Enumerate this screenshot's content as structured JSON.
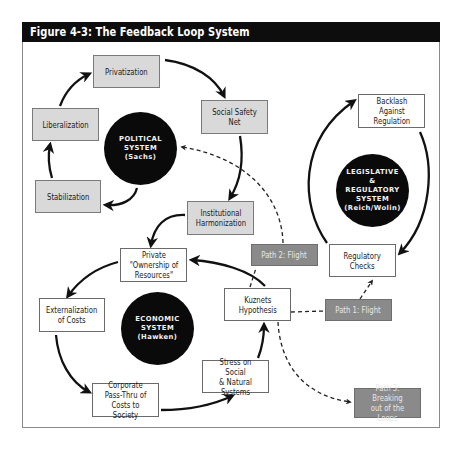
{
  "figure": {
    "title": "Figure 4-3: The Feedback Loop System"
  },
  "systems": {
    "political": {
      "label": "POLITICAL\nSYSTEM\n(Sachs)"
    },
    "legislative": {
      "label": "LEGISLATIVE\n&\nREGULATORY\nSYSTEM\n(Reich/Wolin)"
    },
    "economic": {
      "label": "ECONOMIC\nSYSTEM\n(Hawken)"
    }
  },
  "political_loop": {
    "privatization": "Privatization",
    "social_safety_net": "Social Safety\nNet",
    "institutional_harmonization": "Institutional\nHarmonization",
    "stabilization": "Stabilization",
    "liberalization": "Liberalization"
  },
  "legislative_loop": {
    "backlash": "Backlash\nAgainst\nRegulation",
    "regulatory_checks": "Regulatory\nChecks"
  },
  "economic_loop": {
    "private_ownership": "Private\n\"Ownership of\nResources\"",
    "externalization": "Externalization\nof Costs",
    "corporate_pass_thru": "Corporate\nPass-Thru of\nCosts to Society",
    "stress": "Stress on Social\n& Natural\nSystems",
    "kuznets": "Kuznets\nHypothesis"
  },
  "paths": {
    "path1": "Path 1: Flight",
    "path2": "Path 2: Flight",
    "path3": "Path 3: Breaking\nout of the Loops"
  },
  "colors": {
    "title_bar": "#0d0d0d",
    "system_circle": "#0a0a0a",
    "political_box": "#d9d9d9",
    "path_box": "#8a8a8a",
    "arrow": "#111111"
  }
}
